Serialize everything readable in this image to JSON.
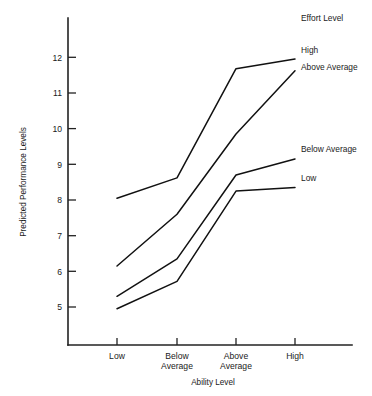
{
  "chart_data": {
    "type": "line",
    "title": "",
    "xlabel": "Ability Level",
    "ylabel": "Predicted Performance Levels",
    "categories": [
      "Low",
      "Below Average",
      "Above Average",
      "High"
    ],
    "category_labels": [
      [
        "Low"
      ],
      [
        "Below",
        "Average"
      ],
      [
        "Above",
        "Average"
      ],
      [
        "High"
      ]
    ],
    "ytick_labels": [
      "12",
      "11",
      "10",
      "9",
      "8",
      "7",
      "6",
      "5"
    ],
    "yticks": [
      12,
      11,
      10,
      9,
      8,
      7,
      6,
      5
    ],
    "ylim": [
      4.2,
      12.6
    ],
    "grid": false,
    "legend_title": "Effort Level",
    "legend_position": "right-inline",
    "series": [
      {
        "name": "High",
        "values": [
          8.05,
          8.62,
          11.68,
          11.95
        ]
      },
      {
        "name": "Above Average",
        "values": [
          6.15,
          7.6,
          9.85,
          11.62
        ]
      },
      {
        "name": "Below Average",
        "values": [
          5.3,
          6.35,
          8.7,
          9.15
        ]
      },
      {
        "name": "Low",
        "values": [
          4.95,
          5.72,
          8.25,
          8.35
        ]
      }
    ]
  },
  "legend": {
    "title": "Effort Level",
    "entries": [
      {
        "label": "High"
      },
      {
        "label": "Above Average"
      },
      {
        "label": "Below Average"
      },
      {
        "label": "Low"
      }
    ]
  },
  "axes": {
    "y_title": "Predicted Performance Levels",
    "x_title": "Ability Level"
  },
  "caption": {
    "text": ""
  }
}
